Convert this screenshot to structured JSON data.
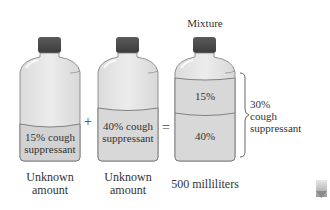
{
  "title": "Mixture",
  "operators": {
    "plus": "+",
    "equals": "="
  },
  "bottles": [
    {
      "id": "bottle-a",
      "content_line1": "15% cough",
      "content_line2": "suppressant",
      "amount_line1": "Unknown",
      "amount_line2": "amount"
    },
    {
      "id": "bottle-b",
      "content_line1": "40% cough",
      "content_line2": "suppressant",
      "amount_line1": "Unknown",
      "amount_line2": "amount"
    },
    {
      "id": "bottle-mixture",
      "layer_top": "15%",
      "layer_bottom": "40%",
      "amount": "500 milliliters"
    }
  ],
  "result": {
    "line1": "30%",
    "line2": "cough",
    "line3": "suppressant"
  },
  "colors": {
    "glass": "#e4e4e4",
    "liquid": "#d6d6d6",
    "cap": "#4a4a4a",
    "outline": "#6a6a6a"
  },
  "icons": {
    "corner": "pencil-icon"
  }
}
